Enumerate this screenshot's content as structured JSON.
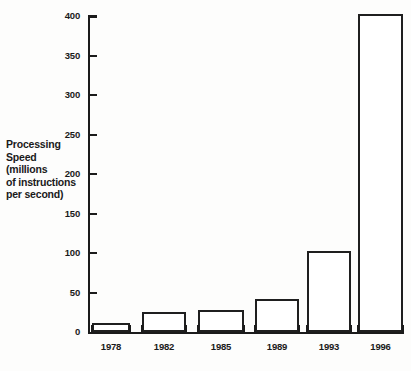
{
  "chart_data": {
    "type": "bar",
    "title": "",
    "subtitle": "",
    "xlabel": "",
    "ylabel": "Processing Speed (millions of instructions per second)",
    "ylabel_lines": [
      "Processing",
      "Speed",
      "(millions",
      "of instructions",
      "per second)"
    ],
    "categories": [
      "1978",
      "1982",
      "1985",
      "1989",
      "1993",
      "1996"
    ],
    "values": [
      12,
      25,
      28,
      42,
      103,
      403
    ],
    "ylim": [
      0,
      403
    ],
    "yticks": [
      0,
      50,
      100,
      150,
      200,
      250,
      300,
      350,
      400
    ],
    "ytick_labels": [
      "0",
      "50",
      "100",
      "150",
      "200",
      "250",
      "300",
      "350",
      "400"
    ],
    "grid": false,
    "legend": null,
    "legend_position": "none",
    "series": [
      {
        "name": "Processing Speed",
        "values": [
          12,
          25,
          28,
          42,
          103,
          403
        ]
      }
    ],
    "bar_style": {
      "fill": "#ffffff",
      "edge": "#1f1f1f"
    },
    "background": "#fdfdfc"
  }
}
